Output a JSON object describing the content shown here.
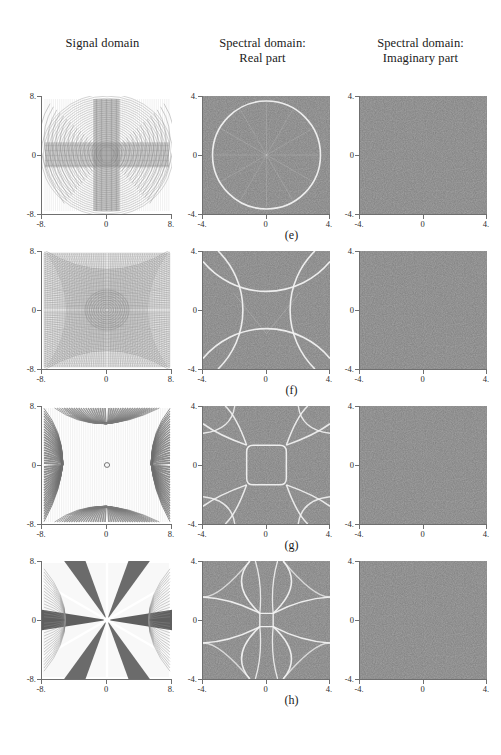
{
  "figure": {
    "width": 501,
    "height": 755,
    "background": "#ffffff",
    "panel_gray": "#808080",
    "caustic_color": "#f2f2f2",
    "axis_color": "#6f6f6f"
  },
  "headers": {
    "signal": {
      "line1": "Signal domain",
      "line2": ""
    },
    "real": {
      "line1": "Spectral domain:",
      "line2": "Real part"
    },
    "imag": {
      "line1": "Spectral domain:",
      "line2": "Imaginary part"
    }
  },
  "axes": {
    "signal": {
      "x_ticks": [
        "-8.",
        "0",
        "8."
      ],
      "y_ticks": [
        "8.",
        "0",
        "-8."
      ],
      "xlim": [
        -8,
        8
      ],
      "ylim": [
        -8,
        8
      ]
    },
    "spectral": {
      "x_ticks": [
        "-4.",
        "0",
        "4."
      ],
      "y_ticks": [
        "4.",
        "0",
        "-4."
      ],
      "xlim": [
        -4,
        4
      ],
      "ylim": [
        -4,
        4
      ]
    }
  },
  "rows": [
    {
      "id": "e",
      "label": "(e)",
      "signal": {
        "pattern": "radial-chirp-circular",
        "description": "concentric/radial moiré chirp with vertical and horizontal bright bands through the origin"
      },
      "real": {
        "pattern": "circle",
        "description": "single bright circular caustic of radius 3.4 with faint radial spokes",
        "radius": 3.4
      },
      "imaginary": {
        "pattern": "uniform",
        "description": "uniform mid-gray, zero everywhere"
      }
    },
    {
      "id": "f",
      "label": "(f)",
      "signal": {
        "pattern": "dense-moire",
        "description": "dense fine interference fringes, four-fold symmetric"
      },
      "real": {
        "pattern": "astroid-arcs",
        "description": "four concave arcs pinching the square corners, forming a cushion shape",
        "radius": 5.2
      },
      "imaginary": {
        "pattern": "uniform",
        "description": "uniform mid-gray, zero everywhere"
      }
    },
    {
      "id": "g",
      "label": "(g)",
      "signal": {
        "pattern": "bowtie-chirp",
        "description": "four-lobed hourglass chirp with horizontal and vertical fans"
      },
      "real": {
        "pattern": "rounded-square-plus-corner-arcs",
        "description": "central rounded square caustic with four arcs sweeping to the corners",
        "radius": 1.25
      },
      "imaginary": {
        "pattern": "uniform",
        "description": "uniform mid-gray, zero everywhere"
      }
    },
    {
      "id": "h",
      "label": "(h)",
      "signal": {
        "pattern": "six-point-star-chirp",
        "description": "six-pointed star / X-shaped chirp radiating from the origin with broad dark lobes"
      },
      "real": {
        "pattern": "butterfly-arcs",
        "description": "butterfly caustic: crossing arcs forming opposing wings above, below, left and right of the origin",
        "radius": 2.2
      },
      "imaginary": {
        "pattern": "uniform",
        "description": "uniform mid-gray, zero everywhere"
      }
    }
  ],
  "chart_data": {
    "type": "heatmap",
    "title": "",
    "layout": {
      "rows": 4,
      "cols": 3,
      "grid": false,
      "legend": "none"
    },
    "columns": [
      "Signal domain",
      "Spectral domain: Real part",
      "Spectral domain: Imaginary part"
    ],
    "row_labels": [
      "(e)",
      "(f)",
      "(g)",
      "(h)"
    ],
    "xlabel": "",
    "ylabel": "",
    "signal_axis": {
      "xlim": [
        -8,
        8
      ],
      "ylim": [
        -8,
        8
      ],
      "xticks": [
        -8,
        0,
        8
      ],
      "yticks": [
        -8,
        0,
        8
      ]
    },
    "spectral_axis": {
      "xlim": [
        -4,
        4
      ],
      "ylim": [
        -4,
        4
      ],
      "xticks": [
        -4,
        0,
        4
      ],
      "yticks": [
        -4,
        0,
        4
      ]
    },
    "series": [
      {
        "name": "(e) signal",
        "pattern": "radial-chirp-circular"
      },
      {
        "name": "(e) real",
        "pattern": "circle",
        "caustic_radius": 3.4
      },
      {
        "name": "(e) imaginary",
        "pattern": "uniform",
        "value": 0
      },
      {
        "name": "(f) signal",
        "pattern": "dense-moire"
      },
      {
        "name": "(f) real",
        "pattern": "astroid-arcs",
        "caustic_radius": 5.2
      },
      {
        "name": "(f) imaginary",
        "pattern": "uniform",
        "value": 0
      },
      {
        "name": "(g) signal",
        "pattern": "bowtie-chirp"
      },
      {
        "name": "(g) real",
        "pattern": "rounded-square-plus-corner-arcs",
        "caustic_radius": 1.25
      },
      {
        "name": "(g) imaginary",
        "pattern": "uniform",
        "value": 0
      },
      {
        "name": "(h) signal",
        "pattern": "six-point-star-chirp"
      },
      {
        "name": "(h) real",
        "pattern": "butterfly-arcs",
        "caustic_radius": 2.2
      },
      {
        "name": "(h) imaginary",
        "pattern": "uniform",
        "value": 0
      }
    ]
  }
}
